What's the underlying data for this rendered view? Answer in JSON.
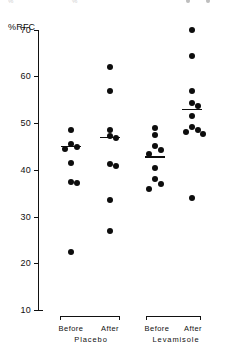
{
  "chart_data": {
    "type": "scatter",
    "title": "",
    "subtitle": "",
    "xlabel": "",
    "ylabel": "%RFC",
    "ylim": [
      10,
      70
    ],
    "yticks": [
      70,
      60,
      50,
      40,
      30,
      20,
      10
    ],
    "grid": false,
    "legend": null,
    "categories": [
      "Before",
      "After",
      "Before",
      "After"
    ],
    "groups": [
      {
        "name": "Before",
        "treatment": "Placebo",
        "x_center": 71,
        "median": 45.0,
        "values": [
          48.5,
          45.5,
          45.0,
          44.6,
          41.5,
          37.5,
          37.3,
          22.5
        ]
      },
      {
        "name": "After",
        "treatment": "Placebo",
        "x_center": 110,
        "median": 47.0,
        "values": [
          62.0,
          57.0,
          48.5,
          47.2,
          46.8,
          41.2,
          40.8,
          33.5,
          27.0
        ]
      },
      {
        "name": "Before",
        "treatment": "Levamisole",
        "x_center": 155,
        "median": 42.8,
        "values": [
          49.0,
          47.6,
          45.2,
          44.3,
          43.4,
          40.5,
          38.0,
          37.0,
          36.0
        ]
      },
      {
        "name": "After",
        "treatment": "Levamisole",
        "x_center": 192,
        "median": 53.0,
        "values": [
          70.0,
          64.5,
          57.0,
          54.3,
          53.8,
          51.5,
          49.2,
          48.6,
          48.2,
          47.8,
          34.0
        ]
      }
    ],
    "treatments": [
      {
        "label": "Placebo",
        "left_label": "Before",
        "right_label": "After"
      },
      {
        "label": "Levamisole",
        "left_label": "Before",
        "right_label": "After"
      }
    ],
    "colors": {
      "marker": "#0d0d0d",
      "axis": "#111111",
      "median": "#0d0d0d",
      "background": "#ffffff"
    }
  },
  "axis": {
    "y_label": "%RFC",
    "ticks": [
      "70",
      "60",
      "50",
      "40",
      "30",
      "20",
      "10"
    ]
  },
  "bottom": {
    "placebo": {
      "before": "Before",
      "after": "After",
      "name": "Placebo"
    },
    "levamisole": {
      "before": "Before",
      "after": "After",
      "name": "Levamisole"
    }
  },
  "artifact": {
    "left_text": "%",
    "mid_text": "%"
  }
}
